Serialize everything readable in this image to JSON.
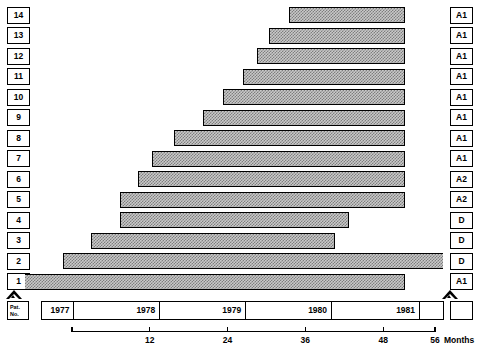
{
  "chart_data": {
    "type": "bar",
    "subtype": "gantt-horizontal-timeline",
    "title": "",
    "xlabel": "Months",
    "ylabel": "Pat. No.",
    "xlim": [
      0,
      56
    ],
    "grid": false,
    "legend": null,
    "xaxis": {
      "unit_label": "Months",
      "tick_values": [
        12,
        24,
        36,
        48,
        56
      ],
      "tick_labels": [
        "12",
        "24",
        "36",
        "48",
        "56"
      ],
      "start_value": 0
    },
    "year_axis": {
      "row_label": "Pat.\nNo.",
      "row_label_line1": "Pat.",
      "row_label_line2": "No.",
      "cells": [
        {
          "label": "1977",
          "start_month": 0.0,
          "end_month": 4.5
        },
        {
          "label": "1978",
          "start_month": 4.5,
          "end_month": 16.5
        },
        {
          "label": "1979",
          "start_month": 16.5,
          "end_month": 28.5
        },
        {
          "label": "1980",
          "start_month": 28.5,
          "end_month": 40.5
        },
        {
          "label": "1981",
          "start_month": 40.5,
          "end_month": 52.8
        },
        {
          "label": "",
          "start_month": 52.8,
          "end_month": 56.2
        }
      ]
    },
    "categories": [
      "1",
      "2",
      "3",
      "4",
      "5",
      "6",
      "7",
      "8",
      "9",
      "10",
      "11",
      "12",
      "13",
      "14"
    ],
    "row_codes": [
      "A1",
      "D",
      "D",
      "D",
      "A2",
      "A2",
      "A1",
      "A1",
      "A1",
      "A1",
      "A1",
      "A1",
      "A1",
      "A1"
    ],
    "bars": [
      {
        "patient": "14",
        "code": "A1",
        "start_month": 33.5,
        "end_month": 51.3,
        "duration_months": 17.8
      },
      {
        "patient": "13",
        "code": "A1",
        "start_month": 30.4,
        "end_month": 51.3,
        "duration_months": 20.9
      },
      {
        "patient": "12",
        "code": "A1",
        "start_month": 28.6,
        "end_month": 51.3,
        "duration_months": 22.7
      },
      {
        "patient": "11",
        "code": "A1",
        "start_month": 26.4,
        "end_month": 51.3,
        "duration_months": 24.9
      },
      {
        "patient": "10",
        "code": "A1",
        "start_month": 23.3,
        "end_month": 51.3,
        "duration_months": 28.0
      },
      {
        "patient": "9",
        "code": "A1",
        "start_month": 20.2,
        "end_month": 51.3,
        "duration_months": 31.1
      },
      {
        "patient": "8",
        "code": "A1",
        "start_month": 15.8,
        "end_month": 51.3,
        "duration_months": 35.5
      },
      {
        "patient": "7",
        "code": "A1",
        "start_month": 12.3,
        "end_month": 51.3,
        "duration_months": 39.0
      },
      {
        "patient": "6",
        "code": "A2",
        "start_month": 10.2,
        "end_month": 51.3,
        "duration_months": 41.1
      },
      {
        "patient": "5",
        "code": "A2",
        "start_month": 7.4,
        "end_month": 51.3,
        "duration_months": 43.9
      },
      {
        "patient": "4",
        "code": "D",
        "start_month": 7.4,
        "end_month": 42.7,
        "duration_months": 35.3
      },
      {
        "patient": "3",
        "code": "D",
        "start_month": 3.0,
        "end_month": 40.6,
        "duration_months": 37.6
      },
      {
        "patient": "2",
        "code": "D",
        "start_month": -1.4,
        "end_month": 80.0,
        "duration_months": 81.4
      },
      {
        "patient": "1",
        "code": "A1",
        "start_month": -13.6,
        "end_month": 51.3,
        "duration_months": 64.9
      }
    ],
    "markers": [
      {
        "name": "start-marker",
        "shape": "triangle",
        "position": "left-baseline"
      },
      {
        "name": "end-marker",
        "shape": "triangle",
        "position": "right-baseline"
      }
    ],
    "colors": {
      "bar_fill": "#c9c9c9",
      "bar_pattern": "#7e7e7e",
      "outline": "#000000",
      "background": "#ffffff"
    }
  }
}
